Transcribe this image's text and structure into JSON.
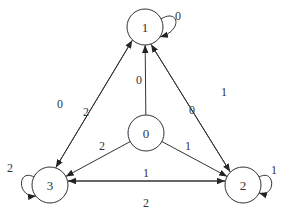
{
  "diagram": {
    "type": "state-transition-graph",
    "nodes": [
      {
        "id": "0",
        "label": "0"
      },
      {
        "id": "1",
        "label": "1"
      },
      {
        "id": "2",
        "label": "2"
      },
      {
        "id": "3",
        "label": "3"
      }
    ],
    "edges": [
      {
        "from": "1",
        "to": "1",
        "label": "0"
      },
      {
        "from": "2",
        "to": "2",
        "label": "1"
      },
      {
        "from": "3",
        "to": "3",
        "label": "2"
      },
      {
        "from": "0",
        "to": "1",
        "label": "0"
      },
      {
        "from": "0",
        "to": "2",
        "label": "1"
      },
      {
        "from": "0",
        "to": "3",
        "label": "2"
      },
      {
        "from": "3",
        "to": "1",
        "label": "0"
      },
      {
        "from": "1",
        "to": "3",
        "label": "2"
      },
      {
        "from": "1",
        "to": "2",
        "label": "1"
      },
      {
        "from": "2",
        "to": "1",
        "label": "0"
      },
      {
        "from": "3",
        "to": "2",
        "label": "1"
      },
      {
        "from": "2",
        "to": "3",
        "label": "2"
      }
    ]
  }
}
